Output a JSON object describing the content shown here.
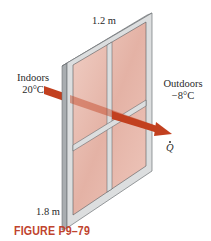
{
  "figure": {
    "caption": "FIGURE P9–79",
    "caption_color": "#c0442e",
    "labels": {
      "width": "1.2 m",
      "height": "1.8 m",
      "indoors_title": "Indoors",
      "indoors_temp": "20°C",
      "outdoors_title": "Outdoors",
      "outdoors_temp": "−8°C",
      "heat_flow": "Q"
    },
    "colors": {
      "frame_face": "#dcdedf",
      "frame_side": "#a9adb0",
      "frame_edge": "#6e7275",
      "glass": "#e6b7ab",
      "glass_light": "#f2d3ca",
      "arrow": "#c2401f"
    }
  }
}
